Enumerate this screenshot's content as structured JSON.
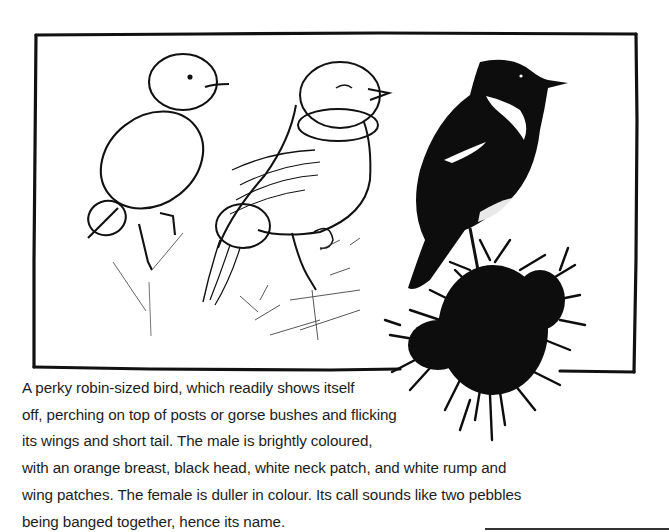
{
  "illustration": {
    "panel": "drawing-steps-frame",
    "steps": [
      {
        "name": "step-1-basic-shapes",
        "description": "Circles and ovals forming head, body and tail with stick legs"
      },
      {
        "name": "step-2-outline",
        "description": "Refined outline with wing feathers, beak, eye and perch"
      },
      {
        "name": "step-3-finished",
        "description": "Finished inked stonechat perched on gorse"
      }
    ]
  },
  "description": {
    "lines": [
      "A perky robin-sized bird, which readily shows itself",
      "off, perching on top of posts or gorse bushes and flicking",
      "its wings and short tail. The male is brightly coloured,",
      "with an orange breast, black head, white neck patch, and white rump and",
      "wing patches. The female is duller in colour. Its call sounds like two pebbles",
      "being banged together, hence its name."
    ]
  },
  "colors": {
    "ink": "#111111",
    "paper": "#ffffff",
    "text": "#1d1d1d"
  }
}
